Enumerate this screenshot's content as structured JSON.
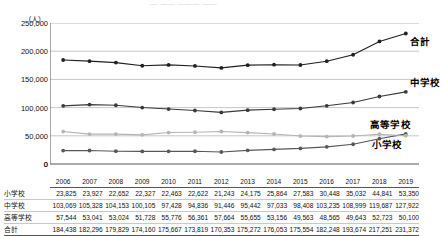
{
  "title_sliver": "—   ——   ———  ——",
  "chart": {
    "y_unit_label": "（人）",
    "zero_label": "0",
    "series_labels": {
      "total": "合計",
      "junior_high": "中学校",
      "high_school": "高等学校",
      "elementary": "小学校"
    },
    "colors": {
      "total": "#231f20",
      "junior_high": "#3a3a3a",
      "high_school": "#b4b4b4",
      "elementary": "#585858",
      "gridline": "#b9b9b9",
      "axis": "#555555"
    }
  },
  "table": {
    "row_header_blank": "",
    "row_labels": [
      "小学校",
      "中学校",
      "高等学校",
      "合計"
    ]
  },
  "chart_data": {
    "type": "line",
    "title": "",
    "xlabel": "",
    "ylabel": "（人）",
    "ylim": [
      0,
      250000
    ],
    "yticks": [
      0,
      50000,
      100000,
      150000,
      200000,
      250000
    ],
    "ytick_labels": [
      "0",
      "50,000",
      "100,000",
      "150,000",
      "200,000",
      "250,000"
    ],
    "grid": true,
    "legend": "inline-right-labels",
    "categories": [
      "2006",
      "2007",
      "2008",
      "2009",
      "2010",
      "2011",
      "2012",
      "2013",
      "2014",
      "2015",
      "2016",
      "2017",
      "2018",
      "2019"
    ],
    "series": [
      {
        "name": "小学校",
        "values": [
          23825,
          23927,
          22652,
          22327,
          22463,
          22622,
          21243,
          24175,
          25864,
          27583,
          30448,
          35032,
          44841,
          53350
        ],
        "value_labels": [
          "23,825",
          "23,927",
          "22,652",
          "22,327",
          "22,463",
          "22,622",
          "21,243",
          "24,175",
          "25,864",
          "27,583",
          "30,448",
          "35,032",
          "44,841",
          "53,350"
        ]
      },
      {
        "name": "中学校",
        "values": [
          103069,
          105328,
          104153,
          100105,
          97428,
          94836,
          91446,
          95442,
          97033,
          98408,
          103235,
          108999,
          119687,
          127922
        ],
        "value_labels": [
          "103,069",
          "105,328",
          "104,153",
          "100,105",
          "97,428",
          "94,836",
          "91,446",
          "95,442",
          "97,033",
          "98,408",
          "103,235",
          "108,999",
          "119,687",
          "127,922"
        ]
      },
      {
        "name": "高等学校",
        "values": [
          57544,
          53041,
          53024,
          51728,
          55776,
          56361,
          57664,
          55655,
          53156,
          49563,
          48565,
          49643,
          52723,
          50100
        ],
        "value_labels": [
          "57,544",
          "53,041",
          "53,024",
          "51,728",
          "55,776",
          "56,361",
          "57,664",
          "55,655",
          "53,156",
          "49,563",
          "48,565",
          "49,643",
          "52,723",
          "50,100"
        ]
      },
      {
        "name": "合計",
        "values": [
          184438,
          182296,
          179829,
          174160,
          175667,
          173819,
          170353,
          175272,
          176053,
          175554,
          182248,
          193674,
          217251,
          231372
        ],
        "value_labels": [
          "184,438",
          "182,296",
          "179,829",
          "174,160",
          "175,667",
          "173,819",
          "170,353",
          "175,272",
          "176,053",
          "175,554",
          "182,248",
          "193,674",
          "217,251",
          "231,372"
        ]
      }
    ]
  }
}
